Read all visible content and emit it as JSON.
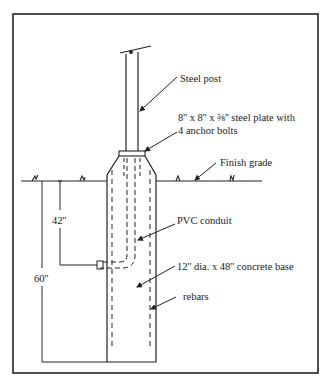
{
  "diagram": {
    "type": "cross-section",
    "line_color": "#222222",
    "background": "#ffffff"
  },
  "labels": {
    "steel_post": "Steel post",
    "plate_line1": "8'' x 8'' x ⅜'' steel plate with",
    "plate_line2": "4 anchor bolts",
    "finish_grade": "Finish grade",
    "pvc_conduit": "PVC conduit",
    "concrete_base": "12'' dia. x 48'' concrete base",
    "rebars": "rebars"
  },
  "dimensions": {
    "conduit_depth": "42''",
    "total_depth": "60''"
  }
}
